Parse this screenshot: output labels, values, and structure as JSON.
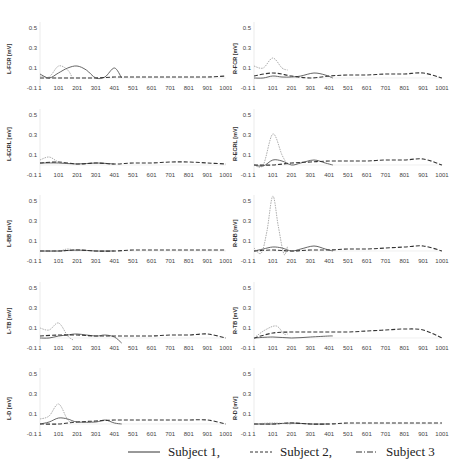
{
  "chart_data": [
    {
      "type": "line",
      "panel": "L-FCR",
      "ylabel": "L-FCR [mV]",
      "ylim": [
        -0.1,
        0.5
      ],
      "yticks": [
        "0.5",
        "0.3",
        "0.1",
        "-0.1"
      ],
      "xticks": [
        "1",
        "101",
        "201",
        "301",
        "401",
        "501",
        "601",
        "701",
        "801",
        "901",
        "1001"
      ],
      "series": [
        {
          "name": "Subject 1",
          "style": "solid",
          "x": [
            1,
            50,
            100,
            150,
            200,
            250,
            301,
            350,
            401,
            440
          ],
          "y": [
            0.04,
            0.0,
            0.05,
            0.1,
            0.12,
            0.08,
            0.0,
            0.01,
            0.1,
            0.0
          ]
        },
        {
          "name": "Subject 2",
          "style": "dashed",
          "x": [
            1,
            101,
            201,
            301,
            401,
            501,
            601,
            701,
            801,
            901,
            1001
          ],
          "y": [
            0.0,
            0.0,
            0.0,
            0.0,
            0.01,
            0.01,
            0.01,
            0.01,
            0.01,
            0.01,
            0.02
          ]
        },
        {
          "name": "Subject 3",
          "style": "dashdot",
          "x": [
            1,
            50,
            101,
            150,
            175
          ],
          "y": [
            0.02,
            0.01,
            0.12,
            0.08,
            0.0
          ]
        }
      ]
    },
    {
      "type": "line",
      "panel": "R-FCR",
      "ylabel": "R-FCR [mV]",
      "ylim": [
        -0.1,
        0.5
      ],
      "yticks": [
        "0.5",
        "0.3",
        "0.1",
        "-0.1"
      ],
      "xticks": [
        "1",
        "101",
        "201",
        "301",
        "401",
        "501",
        "601",
        "701",
        "801",
        "901",
        "1001"
      ],
      "series": [
        {
          "name": "Subject 1",
          "style": "solid",
          "x": [
            1,
            50,
            101,
            150,
            201,
            250,
            320,
            380,
            420
          ],
          "y": [
            0.0,
            0.0,
            0.02,
            0.01,
            0.01,
            0.02,
            0.05,
            0.03,
            0.0
          ]
        },
        {
          "name": "Subject 2",
          "style": "dashed",
          "x": [
            1,
            101,
            201,
            301,
            401,
            501,
            601,
            701,
            801,
            901,
            1001
          ],
          "y": [
            0.02,
            0.05,
            0.02,
            0.0,
            0.02,
            0.03,
            0.03,
            0.04,
            0.04,
            0.05,
            0.0
          ]
        },
        {
          "name": "Subject 3",
          "style": "dashdot",
          "x": [
            1,
            50,
            101,
            150,
            180
          ],
          "y": [
            0.12,
            0.1,
            0.2,
            0.1,
            0.08
          ]
        }
      ]
    },
    {
      "type": "line",
      "panel": "L-ECRL",
      "ylabel": "L-ECRL [mV]",
      "ylim": [
        -0.1,
        0.5
      ],
      "yticks": [
        "0.5",
        "0.3",
        "0.1",
        "-0.1"
      ],
      "xticks": [
        "1",
        "101",
        "201",
        "301",
        "401",
        "501",
        "601",
        "701",
        "801",
        "901",
        "1001"
      ],
      "series": [
        {
          "name": "Subject 1",
          "style": "solid",
          "x": [
            1,
            101,
            201,
            301,
            401
          ],
          "y": [
            0.02,
            0.02,
            0.01,
            0.02,
            0.01
          ]
        },
        {
          "name": "Subject 2",
          "style": "dashed",
          "x": [
            1,
            101,
            201,
            301,
            401,
            501,
            601,
            701,
            801,
            901,
            1001
          ],
          "y": [
            0.02,
            0.03,
            0.01,
            0.02,
            0.01,
            0.02,
            0.02,
            0.03,
            0.03,
            0.02,
            0.01
          ]
        },
        {
          "name": "Subject 3",
          "style": "dashdot",
          "x": [
            1,
            50,
            101,
            150
          ],
          "y": [
            0.05,
            0.08,
            0.03,
            0.02
          ]
        }
      ]
    },
    {
      "type": "line",
      "panel": "R-ECRL",
      "ylabel": "R-ECRL [mV]",
      "ylim": [
        -0.1,
        0.5
      ],
      "yticks": [
        "0.5",
        "0.3",
        "0.1",
        "-0.1"
      ],
      "xticks": [
        "1",
        "101",
        "201",
        "301",
        "401",
        "501",
        "601",
        "701",
        "801",
        "901",
        "1001"
      ],
      "series": [
        {
          "name": "Subject 1",
          "style": "solid",
          "x": [
            1,
            50,
            101,
            150,
            201,
            250,
            320,
            380,
            420
          ],
          "y": [
            0.0,
            -0.01,
            0.05,
            0.04,
            0.0,
            0.02,
            0.05,
            0.02,
            0.0
          ]
        },
        {
          "name": "Subject 2",
          "style": "dashed",
          "x": [
            1,
            101,
            201,
            301,
            401,
            501,
            601,
            701,
            801,
            901,
            1001
          ],
          "y": [
            0.0,
            0.0,
            0.02,
            0.03,
            0.04,
            0.04,
            0.04,
            0.05,
            0.05,
            0.06,
            0.0
          ]
        },
        {
          "name": "Subject 3",
          "style": "dashdot",
          "x": [
            1,
            50,
            101,
            150,
            180
          ],
          "y": [
            0.0,
            0.0,
            0.31,
            0.1,
            0.0
          ]
        }
      ]
    },
    {
      "type": "line",
      "panel": "L-BB",
      "ylabel": "L-BB [mV]",
      "ylim": [
        -0.1,
        0.5
      ],
      "yticks": [
        "0.5",
        "0.3",
        "0.1",
        "-0.1"
      ],
      "xticks": [
        "1",
        "101",
        "201",
        "301",
        "401",
        "501",
        "601",
        "701",
        "801",
        "901",
        "1001"
      ],
      "series": [
        {
          "name": "Subject 1",
          "style": "solid",
          "x": [
            1,
            101,
            201,
            301,
            401
          ],
          "y": [
            0.0,
            0.0,
            0.01,
            0.0,
            0.0
          ]
        },
        {
          "name": "Subject 2",
          "style": "dashed",
          "x": [
            1,
            101,
            201,
            301,
            401,
            501,
            601,
            701,
            801,
            901,
            1001
          ],
          "y": [
            0.0,
            0.0,
            0.01,
            0.0,
            0.0,
            0.01,
            0.01,
            0.01,
            0.01,
            0.01,
            0.01
          ]
        },
        {
          "name": "Subject 3",
          "style": "dashdot",
          "x": [
            1,
            101,
            150,
            201
          ],
          "y": [
            0.0,
            0.0,
            0.02,
            0.0
          ]
        }
      ]
    },
    {
      "type": "line",
      "panel": "R-BB",
      "ylabel": "R-BB [mV]",
      "ylim": [
        -0.1,
        0.5
      ],
      "yticks": [
        "0.5",
        "0.3",
        "0.1",
        "-0.1"
      ],
      "xticks": [
        "1",
        "101",
        "201",
        "301",
        "401",
        "501",
        "601",
        "701",
        "801",
        "901",
        "1001"
      ],
      "series": [
        {
          "name": "Subject 1",
          "style": "solid",
          "x": [
            1,
            50,
            101,
            150,
            201,
            250,
            320,
            380,
            420
          ],
          "y": [
            0.0,
            0.02,
            0.04,
            0.03,
            0.0,
            0.02,
            0.05,
            0.02,
            0.0
          ]
        },
        {
          "name": "Subject 2",
          "style": "dashed",
          "x": [
            1,
            101,
            201,
            301,
            401,
            501,
            601,
            701,
            801,
            901,
            1001
          ],
          "y": [
            0.0,
            0.01,
            0.0,
            0.01,
            0.01,
            0.02,
            0.02,
            0.03,
            0.04,
            0.05,
            0.0
          ]
        },
        {
          "name": "Subject 3",
          "style": "dashdot",
          "x": [
            1,
            40,
            70,
            101,
            130,
            160,
            180
          ],
          "y": [
            0.03,
            -0.02,
            0.2,
            0.55,
            0.25,
            -0.03,
            0.05
          ]
        }
      ]
    },
    {
      "type": "line",
      "panel": "L-TB",
      "ylabel": "L-TB [mV]",
      "ylim": [
        -0.1,
        0.5
      ],
      "yticks": [
        "0.5",
        "0.3",
        "0.1",
        "-0.1"
      ],
      "xticks": [
        "1",
        "101",
        "201",
        "301",
        "401",
        "501",
        "601",
        "701",
        "801",
        "901",
        "1001"
      ],
      "series": [
        {
          "name": "Subject 1",
          "style": "solid",
          "x": [
            1,
            50,
            101,
            150,
            201,
            301,
            350,
            401,
            440
          ],
          "y": [
            0.0,
            0.0,
            0.02,
            0.03,
            0.04,
            0.02,
            0.03,
            0.01,
            -0.05
          ]
        },
        {
          "name": "Subject 2",
          "style": "dashed",
          "x": [
            1,
            101,
            201,
            301,
            401,
            501,
            601,
            701,
            801,
            901,
            1001
          ],
          "y": [
            0.02,
            0.03,
            0.03,
            0.02,
            0.02,
            0.02,
            0.02,
            0.03,
            0.03,
            0.04,
            0.0
          ]
        },
        {
          "name": "Subject 3",
          "style": "dashdot",
          "x": [
            1,
            50,
            101,
            150,
            180
          ],
          "y": [
            0.1,
            0.08,
            0.15,
            0.02,
            -0.02
          ]
        }
      ]
    },
    {
      "type": "line",
      "panel": "R-TB",
      "ylabel": "R-TB [mV]",
      "ylim": [
        -0.1,
        0.5
      ],
      "yticks": [
        "0.5",
        "0.3",
        "0.1",
        "-0.1"
      ],
      "xticks": [
        "1",
        "101",
        "201",
        "301",
        "401",
        "501",
        "601",
        "701",
        "801",
        "901",
        "1001"
      ],
      "series": [
        {
          "name": "Subject 1",
          "style": "solid",
          "x": [
            1,
            101,
            201,
            301,
            401,
            420
          ],
          "y": [
            0.0,
            0.01,
            0.0,
            0.01,
            0.02,
            0.02
          ]
        },
        {
          "name": "Subject 2",
          "style": "dashed",
          "x": [
            1,
            101,
            201,
            301,
            401,
            501,
            601,
            701,
            801,
            901,
            1001
          ],
          "y": [
            0.0,
            0.05,
            0.06,
            0.06,
            0.06,
            0.06,
            0.07,
            0.08,
            0.09,
            0.08,
            0.0
          ]
        },
        {
          "name": "Subject 3",
          "style": "dashdot",
          "x": [
            1,
            60,
            120,
            160,
            180
          ],
          "y": [
            0.0,
            0.08,
            0.12,
            0.04,
            0.04
          ]
        }
      ]
    },
    {
      "type": "line",
      "panel": "L-D",
      "ylabel": "L-D [mV]",
      "ylim": [
        -0.1,
        0.5
      ],
      "yticks": [
        "0.5",
        "0.3",
        "0.1",
        "-0.1"
      ],
      "xticks": [
        "1",
        "101",
        "201",
        "301",
        "401",
        "501",
        "601",
        "701",
        "801",
        "901",
        "1001"
      ],
      "series": [
        {
          "name": "Subject 1",
          "style": "solid",
          "x": [
            1,
            50,
            101,
            150,
            201,
            301,
            350,
            401,
            440
          ],
          "y": [
            0.0,
            0.02,
            0.06,
            0.05,
            0.02,
            0.02,
            0.04,
            0.01,
            0.0
          ]
        },
        {
          "name": "Subject 2",
          "style": "dashed",
          "x": [
            1,
            101,
            201,
            301,
            401,
            501,
            601,
            701,
            801,
            901,
            1001
          ],
          "y": [
            0.0,
            0.0,
            0.02,
            0.03,
            0.04,
            0.04,
            0.04,
            0.04,
            0.04,
            0.04,
            0.0
          ]
        },
        {
          "name": "Subject 3",
          "style": "dashdot",
          "x": [
            1,
            50,
            101,
            150,
            180
          ],
          "y": [
            0.05,
            0.08,
            0.2,
            0.04,
            0.02
          ]
        }
      ]
    },
    {
      "type": "line",
      "panel": "R-D",
      "ylabel": "R-D [mV]",
      "ylim": [
        -0.1,
        0.5
      ],
      "yticks": [
        "0.5",
        "0.3",
        "0.1",
        "-0.1"
      ],
      "xticks": [
        "1",
        "101",
        "201",
        "301",
        "401",
        "501",
        "601",
        "701",
        "801",
        "901",
        "1001"
      ],
      "series": [
        {
          "name": "Subject 1",
          "style": "solid",
          "x": [
            1,
            101,
            201,
            301,
            401
          ],
          "y": [
            0.0,
            0.0,
            0.01,
            0.0,
            0.0
          ]
        },
        {
          "name": "Subject 2",
          "style": "dashed",
          "x": [
            1,
            101,
            201,
            301,
            401,
            501,
            601,
            701,
            801,
            901,
            1001
          ],
          "y": [
            0.0,
            0.0,
            0.01,
            0.0,
            0.0,
            0.01,
            0.01,
            0.01,
            0.01,
            0.01,
            0.01
          ]
        },
        {
          "name": "Subject 3",
          "style": "dashdot",
          "x": [
            1,
            101,
            201
          ],
          "y": [
            0.0,
            0.01,
            0.0
          ]
        }
      ]
    }
  ],
  "legend": {
    "items": [
      {
        "label": "Subject 1,",
        "style": "solid"
      },
      {
        "label": "Subject 2,",
        "style": "dashed"
      },
      {
        "label": "Subject 3",
        "style": "dashdot"
      }
    ]
  }
}
